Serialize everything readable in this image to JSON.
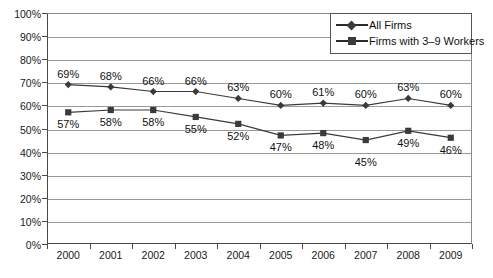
{
  "chart_data": {
    "type": "line",
    "title": "",
    "xlabel": "",
    "ylabel": "",
    "categories": [
      "2000",
      "2001",
      "2002",
      "2003",
      "2004",
      "2005",
      "2006",
      "2007",
      "2008",
      "2009"
    ],
    "series": [
      {
        "name": "All Firms",
        "marker": "diamond",
        "values": [
          69,
          68,
          66,
          66,
          63,
          60,
          61,
          60,
          63,
          60
        ],
        "labels": [
          "69%",
          "68%",
          "66%",
          "66%",
          "63%",
          "60%",
          "61%",
          "60%",
          "63%",
          "60%"
        ],
        "label_position": "above"
      },
      {
        "name": "Firms with 3–9 Workers",
        "marker": "square",
        "values": [
          57,
          58,
          58,
          55,
          52,
          47,
          48,
          45,
          49,
          46
        ],
        "labels": [
          "57%",
          "58%",
          "58%",
          "55%",
          "52%",
          "47%",
          "48%",
          "45%",
          "49%",
          "46%"
        ],
        "label_position": "below"
      }
    ],
    "ylim": [
      0,
      100
    ],
    "y_ticks": [
      "0%",
      "10%",
      "20%",
      "30%",
      "40%",
      "50%",
      "60%",
      "70%",
      "80%",
      "90%",
      "100%"
    ],
    "grid": true,
    "legend_position": "top-right",
    "colors": {
      "line": "#3a3a3a",
      "marker": "#3a3a3a",
      "gridline": "#9a9a9a",
      "axis": "#4a4a4a",
      "text": "#101010",
      "background": "#ffffff"
    }
  },
  "legend": {
    "items": [
      {
        "label": "All Firms"
      },
      {
        "label": "Firms with 3–9 Workers"
      }
    ]
  }
}
